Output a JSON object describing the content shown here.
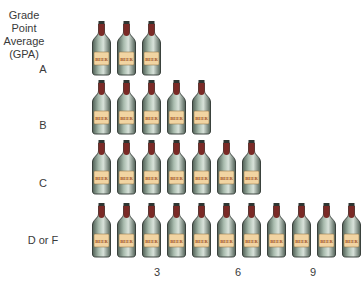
{
  "chart_data": {
    "type": "pictograph",
    "title": "",
    "ylabel": "Grade Point Average (GPA)",
    "ylabel_lines": [
      "Grade Point",
      "Average",
      "(GPA)"
    ],
    "xlabel": "",
    "categories": [
      "A",
      "B",
      "C",
      "D or F"
    ],
    "values": [
      3,
      5,
      7,
      11
    ],
    "unit_icon": "beer-bottle",
    "icon_label": "BEER",
    "x_ticks": [
      3,
      6,
      9
    ],
    "xlim": [
      0,
      11
    ],
    "grid": false,
    "legend": null
  },
  "colors": {
    "bottle_glass": "#a9bcae",
    "bottle_dark": "#4f5f55",
    "cap_foil": "#7a2a26",
    "label_bg": "#f1d4a2",
    "label_text": "#9a4a1a"
  }
}
